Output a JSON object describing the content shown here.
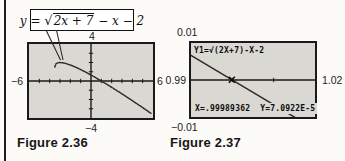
{
  "colors": {
    "page-bg": "#fcfbf8",
    "screen-bg": "#d9d8d3",
    "ink": "#1a1a1a",
    "curve": "#2b2b2b",
    "rule": "#1e1e1e",
    "label": "#222222"
  },
  "fig236": {
    "caption": "Figure 2.36",
    "equation": {
      "lhs": "y = ",
      "sqrt": "√",
      "radicand": "2x + 7",
      "tail": " − x − 2"
    },
    "labels": {
      "top": "4",
      "bottom": "−4",
      "left": "−6",
      "right": "6"
    }
  },
  "fig237": {
    "caption": "Figure 2.37",
    "labels": {
      "top": "0.01",
      "bottom": "−0.01",
      "left": "0.99",
      "right": "1.02"
    },
    "expression": "Y1=√(2X+7)-X-2",
    "readout_x": "X=.99989362",
    "readout_y": "Y=7.0922E-5"
  },
  "chart_data": [
    {
      "figure": "Figure 2.36",
      "type": "line",
      "equation": "y = √(2x+7) − x − 2",
      "xlim": [
        -6,
        6
      ],
      "ylim": [
        -4,
        4
      ],
      "xscl": 1,
      "yscl": 1,
      "axis_labels": {
        "left": "−6",
        "right": "6",
        "top": "4",
        "bottom": "−4"
      },
      "x_intercept": 1,
      "dotted": true,
      "points": [
        [
          -3.5,
          1.5
        ],
        [
          -3.4,
          1.847
        ],
        [
          -3.25,
          1.957
        ],
        [
          -3,
          2
        ],
        [
          -2.5,
          1.914
        ],
        [
          -2,
          1.732
        ],
        [
          -1.5,
          1.5
        ],
        [
          -1,
          1.236
        ],
        [
          -0.5,
          0.949
        ],
        [
          0,
          0.646
        ],
        [
          0.5,
          0.328
        ],
        [
          1,
          0
        ],
        [
          1.5,
          -0.338
        ],
        [
          2,
          -0.683
        ],
        [
          2.5,
          -1.036
        ],
        [
          3,
          -1.394
        ],
        [
          3.5,
          -1.758
        ],
        [
          4,
          -2.127
        ],
        [
          4.5,
          -2.5
        ],
        [
          5,
          -2.877
        ],
        [
          5.5,
          -3.257
        ],
        [
          5.8,
          -3.487
        ]
      ]
    },
    {
      "figure": "Figure 2.37",
      "type": "line",
      "equation": "Y1=√(2X+7)-X-2",
      "xlim": [
        0.99,
        1.02
      ],
      "ylim": [
        -0.01,
        0.01
      ],
      "xscl": 0.01,
      "yscl": 0.01,
      "window_labels": {
        "left": "0.99",
        "right": "1.02",
        "top": "0.01",
        "bottom": "−0.01"
      },
      "dotted": false,
      "points": [
        [
          0.99,
          0.006665
        ],
        [
          1.005,
          -0.003334
        ],
        [
          1.02,
          -0.013341
        ]
      ],
      "trace": {
        "x": 0.99989362,
        "y": 7.0922e-05
      },
      "readout": {
        "x": "X=.99989362",
        "y": "Y=7.0922E-5"
      }
    }
  ]
}
